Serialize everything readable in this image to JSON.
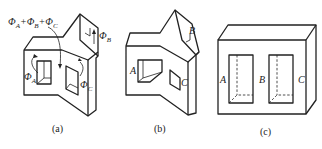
{
  "figure": {
    "panels": [
      {
        "id": "a",
        "caption": "(a)",
        "labels": {
          "sum_flux": "Φ_A+Φ_B+Φ_C",
          "flux_a": "Φ_A",
          "flux_b": "Φ_B",
          "flux_c": "Φ_C"
        }
      },
      {
        "id": "b",
        "caption": "(b)",
        "labels": {
          "a": "A",
          "b": "B",
          "c": "C"
        }
      },
      {
        "id": "c",
        "caption": "(c)",
        "labels": {
          "a": "A",
          "b": "B",
          "c": "C"
        }
      }
    ],
    "colors": {
      "stroke": "#222222",
      "background": "#ffffff"
    }
  }
}
